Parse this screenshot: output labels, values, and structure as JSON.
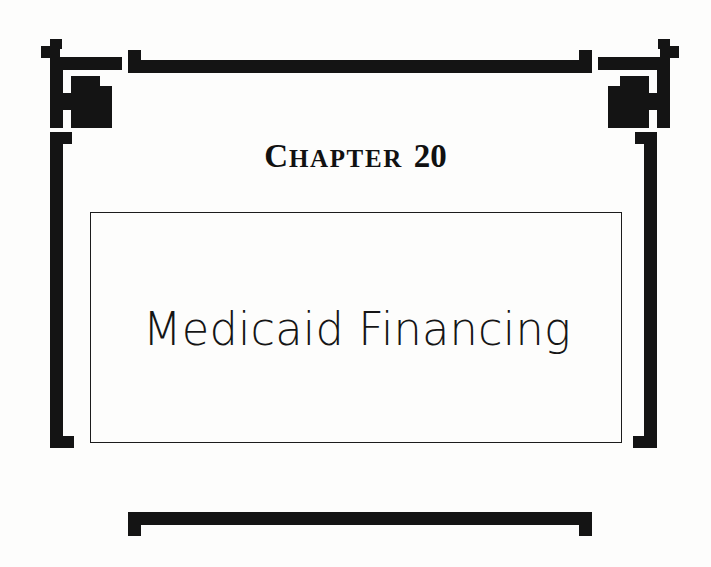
{
  "page": {
    "kind": "book-chapter-title-page",
    "background_color": "#fdfdfc",
    "ink_color": "#111111"
  },
  "chapter": {
    "label_word_first_letter": "C",
    "label_word_rest": "HAPTER",
    "number": "20",
    "full_label": "CHAPTER 20"
  },
  "title": {
    "text": "Medicaid Financing"
  },
  "ornaments": {
    "top_rule_label": "top-horizontal-rule",
    "bottom_rule_label": "bottom-horizontal-rule",
    "corner_top_left": "corner-ornament-top-left",
    "corner_top_right": "corner-ornament-top-right",
    "bracket_left": "left-bracket-spine",
    "bracket_right": "right-bracket-spine",
    "foot_bottom_left": "bracket-foot-bottom-left",
    "foot_bottom_right": "bracket-foot-bottom-right"
  },
  "title_box": {
    "border_color": "#1c1c1c"
  }
}
